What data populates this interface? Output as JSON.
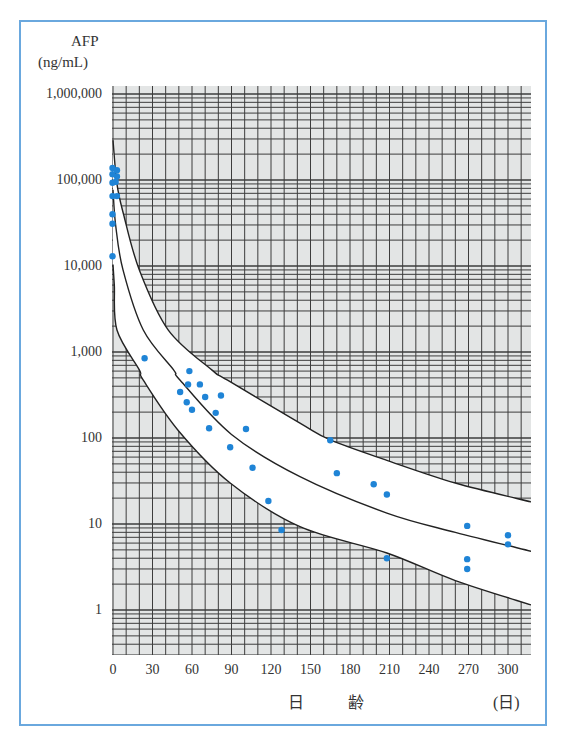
{
  "chart_data": {
    "type": "scatter",
    "title": "",
    "ylabel": "AFP\n(ng/mL)",
    "ylabel_line1": "AFP",
    "ylabel_line2": "(ng/mL)",
    "xlabel": "日　齢",
    "x_unit": "(日)",
    "yscale": "log",
    "ylim": [
      0.5,
      1000000
    ],
    "xlim": [
      0,
      318
    ],
    "grid": true,
    "y_ticks": [
      {
        "value": 1000000,
        "label": "1,000,000"
      },
      {
        "value": 100000,
        "label": "100,000"
      },
      {
        "value": 10000,
        "label": "10,000"
      },
      {
        "value": 1000,
        "label": "1,000"
      },
      {
        "value": 100,
        "label": "100"
      },
      {
        "value": 10,
        "label": "10"
      },
      {
        "value": 1,
        "label": "1"
      }
    ],
    "x_ticks": [
      {
        "value": 0,
        "label": "0"
      },
      {
        "value": 30,
        "label": "30"
      },
      {
        "value": 60,
        "label": "60"
      },
      {
        "value": 90,
        "label": "90"
      },
      {
        "value": 120,
        "label": "120"
      },
      {
        "value": 150,
        "label": "150"
      },
      {
        "value": 180,
        "label": "180"
      },
      {
        "value": 210,
        "label": "210"
      },
      {
        "value": 240,
        "label": "240"
      },
      {
        "value": 270,
        "label": "270"
      },
      {
        "value": 300,
        "label": "300"
      }
    ],
    "curves": [
      {
        "name": "upper",
        "points": [
          [
            0,
            290000
          ],
          [
            3,
            90000
          ],
          [
            8,
            40000
          ],
          [
            20,
            9000
          ],
          [
            42,
            1800
          ],
          [
            75,
            620
          ],
          [
            87,
            470
          ],
          [
            142,
            149
          ],
          [
            165,
            95
          ],
          [
            208,
            55
          ],
          [
            260,
            30
          ],
          [
            318,
            18
          ]
        ]
      },
      {
        "name": "middle",
        "points": [
          [
            0,
            77000
          ],
          [
            2,
            30000
          ],
          [
            7.6,
            9000
          ],
          [
            23,
            1800
          ],
          [
            46,
            620
          ],
          [
            51,
            470
          ],
          [
            90,
            110
          ],
          [
            142,
            35.5
          ],
          [
            208,
            13.4
          ],
          [
            260,
            8
          ],
          [
            318,
            4.8
          ]
        ]
      },
      {
        "name": "lower",
        "points": [
          [
            0,
            10400
          ],
          [
            1,
            6000
          ],
          [
            3,
            1800
          ],
          [
            20,
            620
          ],
          [
            23,
            470
          ],
          [
            50,
            120
          ],
          [
            89,
            30
          ],
          [
            142,
            9.3
          ],
          [
            208,
            4.6
          ],
          [
            260,
            2.2
          ],
          [
            318,
            1.14
          ]
        ]
      }
    ],
    "series": [
      {
        "name": "measurements",
        "color": "#1f84d6",
        "points": [
          [
            0,
            138000
          ],
          [
            3,
            130000
          ],
          [
            0,
            117000
          ],
          [
            3,
            110000
          ],
          [
            0,
            93000
          ],
          [
            2,
            95000
          ],
          [
            0,
            65000
          ],
          [
            3,
            65000
          ],
          [
            0,
            40000
          ],
          [
            0,
            31000
          ],
          [
            0,
            13000
          ],
          [
            24,
            846
          ],
          [
            58,
            600
          ],
          [
            57,
            420
          ],
          [
            66,
            420
          ],
          [
            51,
            343
          ],
          [
            70,
            300
          ],
          [
            82,
            312
          ],
          [
            56,
            260
          ],
          [
            60,
            213
          ],
          [
            78,
            196
          ],
          [
            73,
            130
          ],
          [
            101,
            127
          ],
          [
            89,
            78
          ],
          [
            106,
            45
          ],
          [
            118,
            18.5
          ],
          [
            128,
            8.5
          ],
          [
            165,
            94
          ],
          [
            170,
            39
          ],
          [
            198,
            29
          ],
          [
            208,
            22
          ],
          [
            208,
            4
          ],
          [
            269,
            9.5
          ],
          [
            269,
            3.9
          ],
          [
            269,
            3
          ],
          [
            300,
            7.4
          ],
          [
            300,
            5.8
          ]
        ]
      }
    ],
    "shading": "grid hatching outside normal band (between upper and lower curves is white)"
  },
  "style": {
    "frame_color": "#6aa8de",
    "grid_bg": "#e3e5e5",
    "grid_line": "#3d3d3d",
    "point_color": "#1f84d6",
    "curve_color": "#222222"
  }
}
